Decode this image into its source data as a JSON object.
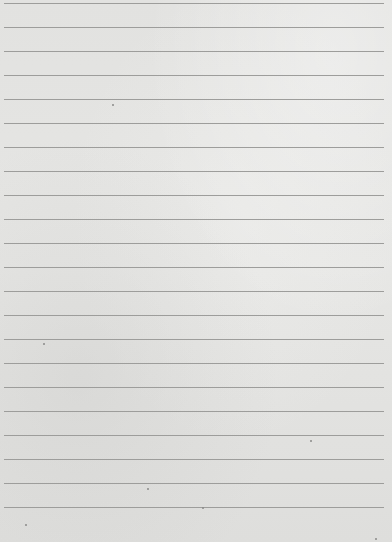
{
  "image": {
    "description": "Lined paper texture",
    "background_color": "#e4e4e2",
    "line_color": "#9d9d9b",
    "line_count": 22,
    "first_line_y": 3,
    "line_spacing": 24,
    "line_left": 4,
    "line_right": 384
  }
}
